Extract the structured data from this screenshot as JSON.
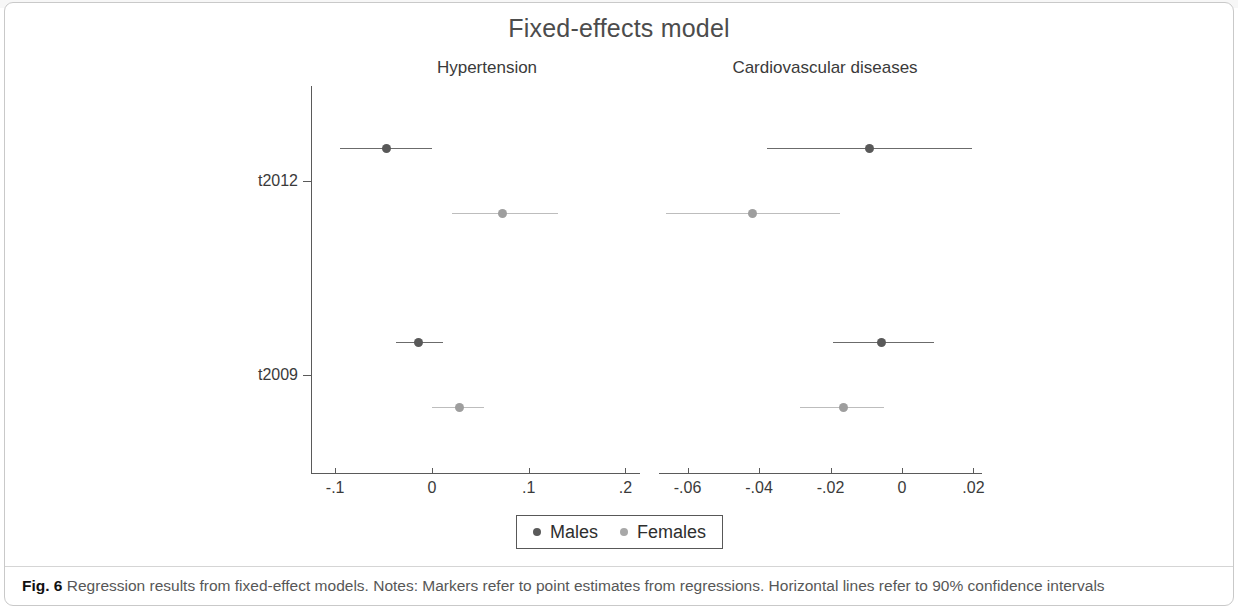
{
  "figure": {
    "title": "Fixed-effects model",
    "caption_label": "Fig. 6",
    "caption_text": "Regression results from fixed-effect models. Notes: Markers refer to point estimates from regressions. Horizontal lines refer to 90% confidence intervals"
  },
  "legend": {
    "items": [
      {
        "label": "Males",
        "color": "#5a5a5a"
      },
      {
        "label": "Females",
        "color": "#a8a8a8"
      }
    ]
  },
  "chart_data": {
    "type": "scatter",
    "title": "Fixed-effects model",
    "subtype": "forest-plot",
    "xlabel": "",
    "ylabel": "",
    "grid": false,
    "legend_position": "bottom",
    "y_categories": [
      "t2012",
      "t2009"
    ],
    "ci_level": "90%",
    "panels": [
      {
        "name": "Hypertension",
        "xlim": [
          -0.125,
          0.215
        ],
        "xticks": [
          -0.1,
          0,
          0.1,
          0.2
        ],
        "xticklabels": [
          "-.1",
          "0",
          ".1",
          ".2"
        ],
        "series": [
          {
            "name": "Males",
            "color": "#5a5a5a",
            "points": [
              {
                "y": "t2012",
                "estimate": -0.047,
                "ci_low": -0.095,
                "ci_high": 0.0
              },
              {
                "y": "t2009",
                "estimate": -0.014,
                "ci_low": -0.037,
                "ci_high": 0.011
              }
            ]
          },
          {
            "name": "Females",
            "color": "#a8a8a8",
            "points": [
              {
                "y": "t2012",
                "estimate": 0.073,
                "ci_low": 0.021,
                "ci_high": 0.13
              },
              {
                "y": "t2009",
                "estimate": 0.028,
                "ci_low": 0.0,
                "ci_high": 0.054
              }
            ]
          }
        ]
      },
      {
        "name": "Cardiovascular diseases",
        "xlim": [
          -0.068,
          0.0224
        ],
        "xticks": [
          -0.06,
          -0.04,
          -0.02,
          0,
          0.02
        ],
        "xticklabels": [
          "-.06",
          "-.04",
          "-.02",
          "0",
          ".02"
        ],
        "series": [
          {
            "name": "Males",
            "color": "#5a5a5a",
            "points": [
              {
                "y": "t2012",
                "estimate": -0.0092,
                "ci_low": -0.0377,
                "ci_high": 0.0197
              },
              {
                "y": "t2009",
                "estimate": -0.0057,
                "ci_low": -0.0193,
                "ci_high": 0.0091
              }
            ]
          },
          {
            "name": "Females",
            "color": "#a8a8a8",
            "points": [
              {
                "y": "t2012",
                "estimate": -0.0419,
                "ci_low": -0.066,
                "ci_high": -0.0173
              },
              {
                "y": "t2009",
                "estimate": -0.0165,
                "ci_low": -0.0284,
                "ci_high": -0.0051
              }
            ]
          }
        ]
      }
    ]
  }
}
